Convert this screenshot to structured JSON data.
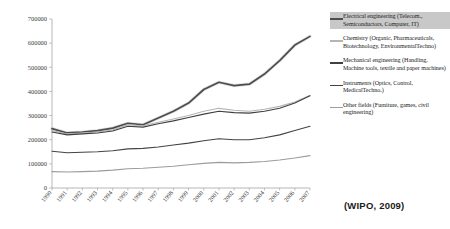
{
  "source_note": "(WIPO, 2009)",
  "legend": {
    "entries": [
      {
        "name": "legend-item-electrical-engineering",
        "label": "Electrical engineering (Telecom., Semiconductors, Computer, IT)",
        "color": "#4d4d4d",
        "highlighted": true
      },
      {
        "name": "legend-item-chemistry",
        "label": "Chemistry (Organic, Pharmaceuticals, Biotechnology, EnvironmentalTechno)",
        "color": "#b5b5b5",
        "highlighted": false
      },
      {
        "name": "legend-item-mechanical-engineering",
        "label": "Mechanical engineering (Handling, Machine tools, textile and paper machines)",
        "color": "#3f3f3f",
        "highlighted": false
      },
      {
        "name": "legend-item-instruments",
        "label": "Instruments (Optics, Control, MedicalTechno.)",
        "color": "#444444",
        "highlighted": false
      },
      {
        "name": "legend-item-other-fields",
        "label": "Other fields (Furniture, games, civil engineering)",
        "color": "#9c9c9c",
        "highlighted": false
      }
    ]
  },
  "chart_data": {
    "type": "line",
    "title": "",
    "xlabel": "",
    "ylabel": "",
    "grid": false,
    "legend_position": "right",
    "x": [
      1990,
      1991,
      1992,
      1993,
      1994,
      1995,
      1996,
      1997,
      1998,
      1999,
      2000,
      2001,
      2002,
      2003,
      2004,
      2005,
      2006,
      2007
    ],
    "xlim": [
      1990,
      2007
    ],
    "ylim": [
      0,
      700000
    ],
    "ytick_labels": [
      "0",
      "100000",
      "200000",
      "300000",
      "400000",
      "500000",
      "600000",
      "700000"
    ],
    "yticks": [
      0,
      100000,
      200000,
      300000,
      400000,
      500000,
      600000,
      700000
    ],
    "xtick_labels": [
      "1990",
      "1991",
      "1992",
      "1993",
      "1994",
      "1995",
      "1996",
      "1997",
      "1998",
      "1999",
      "2000",
      "2001",
      "2002",
      "2003",
      "2004",
      "2005",
      "2006",
      "2007"
    ],
    "series": [
      {
        "name": "Electrical engineering (Telecom., Semiconductors, Computer, IT)",
        "color": "#4d4d4d",
        "halo": true,
        "values": [
          246000,
          228000,
          232000,
          238000,
          248000,
          268000,
          262000,
          290000,
          318000,
          352000,
          408000,
          438000,
          424000,
          430000,
          472000,
          528000,
          592000,
          628000
        ]
      },
      {
        "name": "Chemistry (Organic, Pharmaceuticals, Biotechnology, EnvironmentalTechno)",
        "color": "#b5b5b5",
        "halo": false,
        "values": [
          238000,
          224000,
          228000,
          232000,
          240000,
          262000,
          258000,
          272000,
          286000,
          300000,
          318000,
          330000,
          322000,
          318000,
          326000,
          338000,
          356000,
          384000
        ]
      },
      {
        "name": "Mechanical engineering (Handling, Machine tools, textile and paper machines)",
        "color": "#3f3f3f",
        "halo": false,
        "values": [
          232000,
          220000,
          224000,
          228000,
          236000,
          256000,
          252000,
          266000,
          278000,
          292000,
          306000,
          318000,
          312000,
          310000,
          318000,
          330000,
          352000,
          382000
        ]
      },
      {
        "name": "Instruments (Optics, Control, MedicalTechno.)",
        "color": "#444444",
        "halo": false,
        "values": [
          152000,
          146000,
          148000,
          150000,
          154000,
          162000,
          164000,
          170000,
          178000,
          186000,
          196000,
          204000,
          200000,
          200000,
          208000,
          220000,
          238000,
          256000
        ]
      },
      {
        "name": "Other fields (Furniture, games, civil engineering)",
        "color": "#9c9c9c",
        "halo": false,
        "values": [
          68000,
          66000,
          68000,
          70000,
          74000,
          80000,
          82000,
          86000,
          90000,
          96000,
          102000,
          106000,
          104000,
          106000,
          110000,
          116000,
          124000,
          134000
        ]
      }
    ]
  }
}
